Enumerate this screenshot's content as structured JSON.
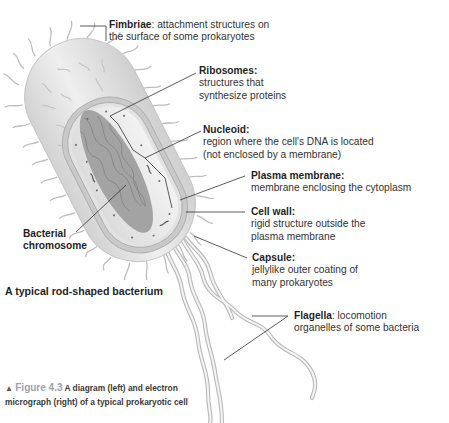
{
  "diagram": {
    "title": "A typical rod-shaped bacterium",
    "labels": [
      {
        "key": "fimbriae",
        "term": "Fimbriae",
        "desc_lines": [
          "attachment structures on",
          "the surface of some prokaryotes"
        ],
        "inline": true
      },
      {
        "key": "ribosomes",
        "term": "Ribosomes",
        "desc_lines": [
          "structures that",
          "synthesize proteins"
        ],
        "inline": false
      },
      {
        "key": "nucleoid",
        "term": "Nucleoid",
        "desc_lines": [
          "region where the cell's DNA is located",
          "(not enclosed by a membrane)"
        ],
        "inline": false
      },
      {
        "key": "plasma_membrane",
        "term": "Plasma membrane",
        "desc_lines": [
          "membrane enclosing the cytoplasm"
        ],
        "inline": false
      },
      {
        "key": "cell_wall",
        "term": "Cell wall",
        "desc_lines": [
          "rigid structure outside the",
          "plasma membrane"
        ],
        "inline": false
      },
      {
        "key": "capsule",
        "term": "Capsule",
        "desc_lines": [
          "jellylike outer coating of",
          "many prokaryotes"
        ],
        "inline": false
      },
      {
        "key": "flagella",
        "term": "Flagella",
        "desc_lines": [
          "locomotion",
          "organelles of some bacteria"
        ],
        "inline": true
      },
      {
        "key": "bacterial_chromosome",
        "term_lines": [
          "Bacterial",
          "chromosome"
        ]
      }
    ],
    "caption": {
      "marker": "▲",
      "figure_number": "Figure 4.3",
      "text": "A diagram (left) and electron micrograph (right) of a typical prokaryotic cell"
    },
    "colors": {
      "capsule_fill": "#e4e4e4",
      "cell_wall": "#c9c9c9",
      "cytoplasm": "#ececec",
      "nucleoid": "#9a9a9a",
      "leader_line": "#333333",
      "figure_label": "#9aa3ad"
    }
  }
}
